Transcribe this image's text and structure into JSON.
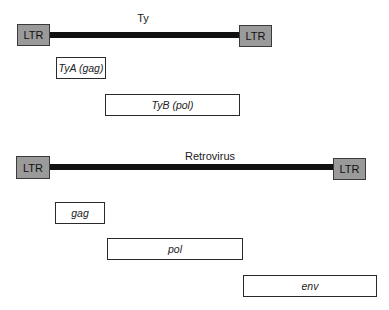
{
  "ty": {
    "title": "Ty",
    "ltr_left": "LTR",
    "ltr_right": "LTR",
    "genes": [
      {
        "label": "TyA (gag)"
      },
      {
        "label": "TyB (pol)"
      }
    ]
  },
  "retrovirus": {
    "title": "Retrovirus",
    "ltr_left": "LTR",
    "ltr_right": "LTR",
    "genes": [
      {
        "label": "gag"
      },
      {
        "label": "pol"
      },
      {
        "label": "env"
      }
    ]
  },
  "colors": {
    "ltr_fill": "#9a9a9a",
    "bar": "#111111",
    "gene_fill": "#ffffff"
  }
}
